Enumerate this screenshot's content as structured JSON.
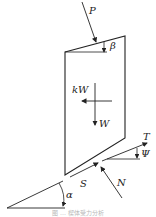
{
  "diagram": {
    "type": "free-body force diagram of a wedge block on an inclined plane",
    "labels": {
      "P": "P",
      "beta": "β",
      "kW": "kW",
      "W": "W",
      "T": "T",
      "psi": "Ψ",
      "S": "S",
      "N": "N",
      "alpha": "α"
    },
    "caption": "图 … 楔体受力分析",
    "colors": {
      "line": "#222222",
      "background": "#ffffff",
      "caption": "#b8b8b8"
    }
  }
}
